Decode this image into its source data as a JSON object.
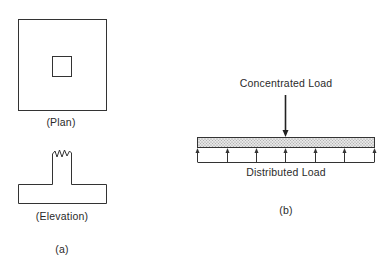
{
  "figure_a": {
    "plan_label": "(Plan)",
    "elevation_label": "(Elevation)",
    "panel_label": "(a)"
  },
  "figure_b": {
    "concentrated_label": "Concentrated Load",
    "distributed_label": "Distributed Load",
    "panel_label": "(b)",
    "distributed_arrow_count": 7
  },
  "colors": {
    "line": "#333333",
    "hatch": "#9a9a9a"
  }
}
